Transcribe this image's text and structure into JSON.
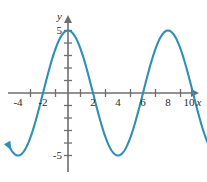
{
  "figure": {
    "axis_labels": {
      "x": "x",
      "y": "y"
    },
    "x_tick_labels": [
      "-4",
      "-2",
      "2",
      "4",
      "6",
      "8",
      "10"
    ],
    "y_tick_labels": [
      "5",
      "-5"
    ],
    "colors": {
      "curve": "#2e8fb5",
      "axis": "#6e6e6e",
      "text": "#2b2b2b",
      "background": "#ffffff"
    }
  },
  "chart_data": {
    "type": "line",
    "title": "",
    "xlabel": "x",
    "ylabel": "y",
    "xlim": [
      -4.8,
      11.8
    ],
    "ylim": [
      -6.2,
      6.2
    ],
    "grid": false,
    "legend": null,
    "function": "y = 5 cos(pi*x/4)",
    "amplitude": 5,
    "period": 8,
    "midline": 0,
    "phase_shift": 0,
    "x_ticks": [
      -4,
      -2,
      2,
      4,
      6,
      8,
      10
    ],
    "x_tick_labels": [
      "-4",
      "-2",
      "2",
      "4",
      "6",
      "8",
      "10"
    ],
    "y_ticks": [
      5,
      -5
    ],
    "y_tick_labels": [
      "5",
      "-5"
    ],
    "y_minor_ticks": [
      -4,
      -3,
      -2,
      -1,
      1,
      2,
      3,
      4
    ],
    "x_minor_ticks": [
      -3,
      -1,
      1,
      3,
      5,
      7,
      9
    ],
    "maxima": [
      {
        "x": 0,
        "y": 5
      },
      {
        "x": 8,
        "y": 5
      }
    ],
    "minima": [
      {
        "x": -4,
        "y": -5
      },
      {
        "x": 4,
        "y": -5
      }
    ],
    "x_intercepts": [
      -2,
      2,
      6,
      10
    ],
    "y_intercept": 5,
    "endpoints": {
      "left": {
        "x": -4.6,
        "y": -4.3,
        "arrow": true
      },
      "right": {
        "x": 11.6,
        "y": -4.6,
        "arrow": true
      }
    },
    "series": [
      {
        "name": "y = 5 cos(pi x / 4)",
        "color": "#2e8fb5",
        "x": [
          -4.6,
          -4.4,
          -4.2,
          -4.0,
          -3.8,
          -3.6,
          -3.4,
          -3.2,
          -3.0,
          -2.8,
          -2.6,
          -2.4,
          -2.2,
          -2.0,
          -1.8,
          -1.6,
          -1.4,
          -1.2,
          -1.0,
          -0.8,
          -0.6,
          -0.4,
          -0.2,
          0.0,
          0.2,
          0.4,
          0.6,
          0.8,
          1.0,
          1.2,
          1.4,
          1.6,
          1.8,
          2.0,
          2.2,
          2.4,
          2.6,
          2.8,
          3.0,
          3.2,
          3.4,
          3.6,
          3.8,
          4.0,
          4.2,
          4.4,
          4.6,
          4.8,
          5.0,
          5.2,
          5.4,
          5.6,
          5.8,
          6.0,
          6.2,
          6.4,
          6.6,
          6.8,
          7.0,
          7.2,
          7.4,
          7.6,
          7.8,
          8.0,
          8.2,
          8.4,
          8.6,
          8.8,
          9.0,
          9.2,
          9.4,
          9.6,
          9.8,
          10.0,
          10.2,
          10.4,
          10.6,
          10.8,
          11.0,
          11.2,
          11.4,
          11.6
        ],
        "y": [
          -4.89,
          -4.96,
          -4.99,
          -5.0,
          -4.99,
          -4.96,
          -4.89,
          -4.8,
          -4.68,
          -4.53,
          -4.35,
          -4.15,
          -3.93,
          -3.68,
          -3.41,
          -3.12,
          -2.82,
          -2.5,
          -2.17,
          -1.82,
          -1.46,
          -1.1,
          -0.74,
          0.0,
          4.94,
          4.76,
          4.46,
          4.05,
          3.54,
          2.94,
          2.27,
          1.55,
          0.78,
          0.0,
          -0.78,
          -1.55,
          -2.27,
          -2.94,
          -3.54,
          -4.05,
          -4.46,
          -4.76,
          -4.94,
          -5.0,
          -4.94,
          -4.76,
          -4.46,
          -4.05,
          -3.54,
          -2.94,
          -2.27,
          -1.55,
          -0.78,
          0.0,
          0.78,
          1.55,
          2.27,
          2.94,
          3.54,
          4.05,
          4.46,
          4.76,
          4.94,
          5.0,
          4.94,
          4.76,
          4.46,
          4.05,
          3.54,
          2.94,
          2.27,
          1.55,
          0.78,
          0.0,
          -0.78,
          -1.55,
          -2.27,
          -2.94,
          -3.54,
          -4.05,
          -4.46,
          -4.76
        ]
      }
    ]
  }
}
